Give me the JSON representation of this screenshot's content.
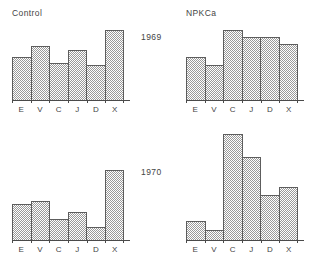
{
  "figure": {
    "background_color": "#ffffff",
    "bar_fill_color": "#9a9a9a",
    "bar_outline_color": "#5d5d5d",
    "axis_color": "#4a4a4a",
    "text_color": "#444444"
  },
  "row_labels": [
    {
      "text": "1969"
    },
    {
      "text": "1970"
    }
  ],
  "panels": [
    {
      "title": "Control",
      "year": "1969",
      "categories": [
        "E",
        "V",
        "C",
        "J",
        "D",
        "X"
      ],
      "values": [
        0.62,
        0.77,
        0.53,
        0.72,
        0.5,
        1.0
      ]
    },
    {
      "title": "NPKCa",
      "year": "1969",
      "categories": [
        "E",
        "V",
        "C",
        "J",
        "D",
        "X"
      ],
      "values": [
        0.62,
        0.5,
        1.0,
        0.9,
        0.9,
        0.8
      ]
    },
    {
      "title": "",
      "year": "1970",
      "categories": [
        "E",
        "V",
        "C",
        "J",
        "D",
        "X"
      ],
      "values": [
        0.52,
        0.56,
        0.3,
        0.4,
        0.18,
        1.0
      ]
    },
    {
      "title": "",
      "year": "1970",
      "categories": [
        "E",
        "V",
        "C",
        "J",
        "D",
        "X"
      ],
      "values": [
        0.18,
        0.09,
        1.0,
        0.78,
        0.42,
        0.5
      ]
    }
  ],
  "chart_data": [
    {
      "type": "bar",
      "title": "Control 1969",
      "categories": [
        "E",
        "V",
        "C",
        "J",
        "D",
        "X"
      ],
      "values": [
        0.62,
        0.77,
        0.53,
        0.72,
        0.5,
        1.0
      ],
      "xlabel": "",
      "ylabel": "",
      "ylim": [
        0,
        1.0
      ],
      "grid": false,
      "legend": "none"
    },
    {
      "type": "bar",
      "title": "NPKCa 1969",
      "categories": [
        "E",
        "V",
        "C",
        "J",
        "D",
        "X"
      ],
      "values": [
        0.62,
        0.5,
        1.0,
        0.9,
        0.9,
        0.8
      ],
      "xlabel": "",
      "ylabel": "",
      "ylim": [
        0,
        1.0
      ],
      "grid": false,
      "legend": "none"
    },
    {
      "type": "bar",
      "title": "Control 1970",
      "categories": [
        "E",
        "V",
        "C",
        "J",
        "D",
        "X"
      ],
      "values": [
        0.52,
        0.56,
        0.3,
        0.4,
        0.18,
        1.0
      ],
      "xlabel": "",
      "ylabel": "",
      "ylim": [
        0,
        1.0
      ],
      "grid": false,
      "legend": "none"
    },
    {
      "type": "bar",
      "title": "NPKCa 1970",
      "categories": [
        "E",
        "V",
        "C",
        "J",
        "D",
        "X"
      ],
      "values": [
        0.18,
        0.09,
        1.0,
        0.78,
        0.42,
        0.5
      ],
      "xlabel": "",
      "ylabel": "",
      "ylim": [
        0,
        1.0
      ],
      "grid": false,
      "legend": "none"
    }
  ]
}
